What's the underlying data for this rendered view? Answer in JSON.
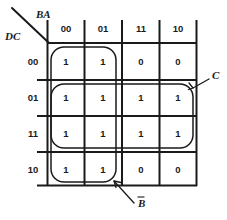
{
  "figure": {
    "type": "karnaugh-map",
    "title": "",
    "variables_top": "BA",
    "variables_side": "DC",
    "column_headers": [
      "00",
      "01",
      "11",
      "10"
    ],
    "row_headers": [
      "00",
      "01",
      "11",
      "10"
    ],
    "cells": [
      [
        "1",
        "1",
        "0",
        "0"
      ],
      [
        "1",
        "1",
        "1",
        "1"
      ],
      [
        "1",
        "1",
        "1",
        "1"
      ],
      [
        "1",
        "1",
        "0",
        "0"
      ]
    ],
    "groups": [
      {
        "name": "c-group",
        "label": "C",
        "has_overbar": false,
        "rows": [
          1,
          2
        ],
        "cols": [
          0,
          1,
          2,
          3
        ]
      },
      {
        "name": "b-not-group",
        "label": "B",
        "has_overbar": true,
        "rows": [
          0,
          1,
          2,
          3
        ],
        "cols": [
          0,
          1
        ]
      }
    ],
    "colors": {
      "ink": "#1a1a1a",
      "background": "#ffffff"
    }
  }
}
